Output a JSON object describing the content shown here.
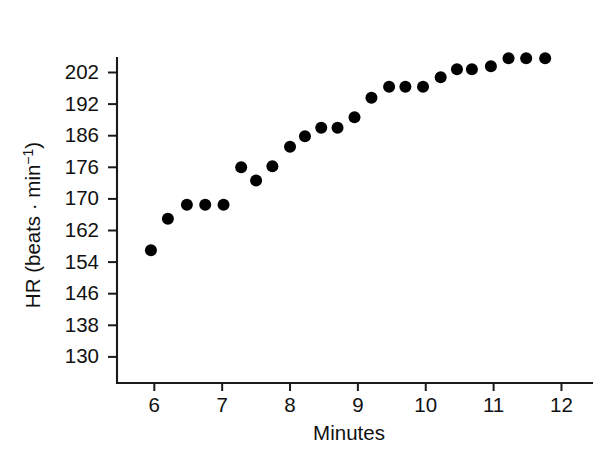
{
  "chart_data": {
    "type": "scatter",
    "title": "",
    "subtitle": "",
    "xlabel": "Minutes",
    "ylabel": "HR (beats · min⁻¹)",
    "ylabel_parts": {
      "prefix": "HR (beats · min",
      "superscript": "−1",
      "suffix": ")"
    },
    "grid": false,
    "legend": null,
    "legend_position": "none",
    "xlim": [
      5.45,
      12.45
    ],
    "ylim": [
      130,
      207.5
    ],
    "xticks": [
      6,
      7,
      8,
      9,
      10,
      11,
      12
    ],
    "xtick_labels": [
      "6",
      "7",
      "8",
      "9",
      "10",
      "11",
      "12"
    ],
    "yticks": [
      130,
      138,
      146,
      154,
      162,
      170,
      176,
      186,
      192,
      202
    ],
    "ytick_labels": [
      "130",
      "138",
      "146",
      "154",
      "162",
      "170",
      "176",
      "186",
      "192",
      "202"
    ],
    "ytick_note": "tick labels are evenly spaced on the axis although their numeric gaps vary",
    "series": [
      {
        "name": "Heart rate",
        "marker": "filled-circle",
        "color": "#000000",
        "points": [
          {
            "x": 5.95,
            "y": 157.0
          },
          {
            "x": 6.2,
            "y": 165.0
          },
          {
            "x": 6.48,
            "y": 168.5
          },
          {
            "x": 6.75,
            "y": 168.5
          },
          {
            "x": 7.02,
            "y": 168.5
          },
          {
            "x": 7.28,
            "y": 176.0
          },
          {
            "x": 7.5,
            "y": 173.5
          },
          {
            "x": 7.74,
            "y": 176.3
          },
          {
            "x": 8.0,
            "y": 182.5
          },
          {
            "x": 8.22,
            "y": 185.8
          },
          {
            "x": 8.46,
            "y": 187.5
          },
          {
            "x": 8.7,
            "y": 187.5
          },
          {
            "x": 8.95,
            "y": 189.5
          },
          {
            "x": 9.2,
            "y": 194.0
          },
          {
            "x": 9.46,
            "y": 197.5
          },
          {
            "x": 9.7,
            "y": 197.5
          },
          {
            "x": 9.96,
            "y": 197.5
          },
          {
            "x": 10.22,
            "y": 200.5
          },
          {
            "x": 10.46,
            "y": 203.0
          },
          {
            "x": 10.68,
            "y": 203.0
          },
          {
            "x": 10.96,
            "y": 204.0
          },
          {
            "x": 11.22,
            "y": 206.5
          },
          {
            "x": 11.48,
            "y": 206.5
          },
          {
            "x": 11.76,
            "y": 206.5
          }
        ]
      }
    ]
  },
  "figure": {
    "marker_radius_px": 6.0,
    "axis_color": "#1a1a1a"
  }
}
